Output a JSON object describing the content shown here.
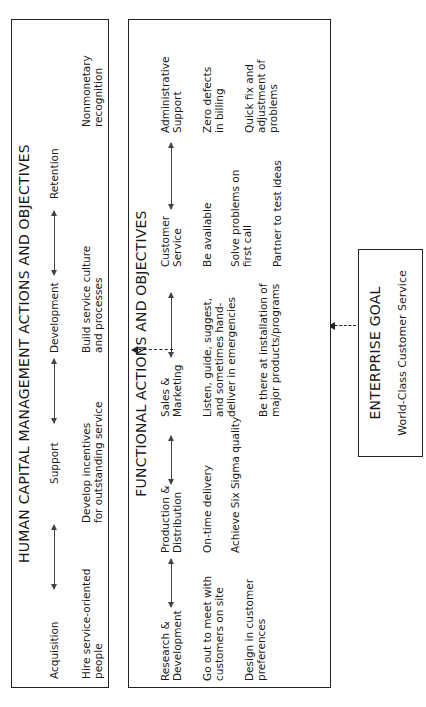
{
  "enterprise_goal": {
    "title": "ENTERPRISE GOAL",
    "subtitle": "World-Class Customer Service"
  },
  "functional": {
    "title": "FUNCTIONAL ACTIONS AND OBJECTIVES",
    "columns": [
      {
        "header": [
          "Research &",
          "Development"
        ],
        "items": [
          [
            "Go out to meet with",
            "customers on site"
          ],
          [
            "Design in customer",
            "preferences"
          ]
        ]
      },
      {
        "header": [
          "Production &",
          "Distribution"
        ],
        "items": [
          [
            "On-time delivery"
          ],
          [
            "Achieve Six Sigma quality"
          ]
        ]
      },
      {
        "header": [
          "Sales &",
          "Marketing"
        ],
        "items": [
          [
            "Listen, guide, suggest,",
            "and sometimes hand-",
            "deliver in emergencies"
          ],
          [
            "Be there at installation of",
            "major products/programs"
          ]
        ]
      },
      {
        "header": [
          "Customer",
          "Service"
        ],
        "items": [
          [
            "Be available"
          ],
          [
            "Solve problems on",
            "first call"
          ],
          [
            "Partner to test ideas"
          ]
        ]
      },
      {
        "header": [
          "Administrative",
          "Support"
        ],
        "items": [
          [
            "Zero defects",
            "in billing"
          ],
          [
            "Quick fix and",
            "adjustment of",
            "problems"
          ]
        ]
      }
    ]
  },
  "human_capital": {
    "title": "HUMAN CAPITAL MANAGEMENT ACTIONS AND OBJECTIVES",
    "columns": [
      {
        "header": "Acquisition",
        "items": [
          [
            "Hire service-oriented",
            "people"
          ]
        ]
      },
      {
        "header": "Support",
        "items": [
          [
            "Develop incentives",
            "for outstanding service"
          ]
        ]
      },
      {
        "header": "Development",
        "items": [
          [
            "Build service culture",
            "and processes"
          ]
        ]
      },
      {
        "header": "Retention",
        "items": [
          [
            "Nonmonetary",
            "recognition"
          ]
        ]
      }
    ]
  }
}
